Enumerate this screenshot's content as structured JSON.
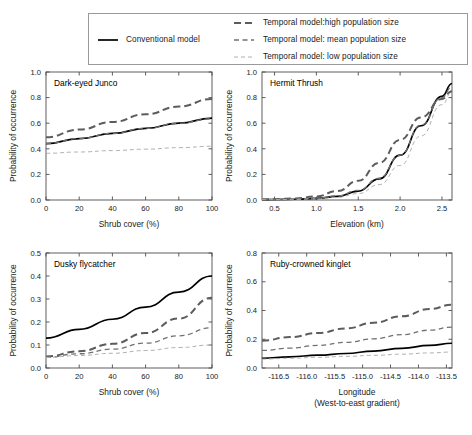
{
  "legend": {
    "entries": [
      {
        "label": "Conventional model",
        "style": "solid",
        "color": "#000000",
        "width": 1.7,
        "dash": "none",
        "position": "left"
      },
      {
        "label": "Temporal model:high population size",
        "style": "dashed",
        "color": "#5c5c5c",
        "width": 2.0,
        "dash": "7,4",
        "position": "right"
      },
      {
        "label": "Temporal model: mean population size",
        "style": "dashed",
        "color": "#707070",
        "width": 1.3,
        "dash": "5,3.5",
        "position": "right"
      },
      {
        "label": "Temporal model: low population size",
        "style": "dashed",
        "color": "#b0b0b0",
        "width": 1.0,
        "dash": "4,3",
        "position": "right"
      }
    ]
  },
  "chart_data": [
    {
      "type": "line",
      "title": "Dark-eyed Junco",
      "xlabel": "Shrub cover (%)",
      "ylabel": "Probability of occurrence",
      "xlim": [
        0,
        100
      ],
      "ylim": [
        0,
        1.0
      ],
      "xticks": [
        0,
        20,
        40,
        60,
        80,
        100
      ],
      "xticklabels": [
        "0",
        "20",
        "40",
        "60",
        "80",
        "100"
      ],
      "yticks": [
        0.0,
        0.2,
        0.4,
        0.6,
        0.8,
        1.0
      ],
      "yticklabels": [
        "0.0",
        "0.2",
        "0.4",
        "0.6",
        "0.8",
        "1.0"
      ],
      "grid": false,
      "series": [
        {
          "name": "Conventional model",
          "style": "solid",
          "color": "#000000",
          "width": 1.7,
          "dash": "none",
          "x": [
            0,
            20,
            40,
            60,
            80,
            100
          ],
          "values": [
            0.44,
            0.48,
            0.52,
            0.56,
            0.6,
            0.64
          ]
        },
        {
          "name": "Temporal model:high population size",
          "style": "dashed",
          "color": "#5c5c5c",
          "width": 2.0,
          "dash": "7,4",
          "x": [
            0,
            20,
            40,
            60,
            80,
            100
          ],
          "values": [
            0.49,
            0.55,
            0.61,
            0.67,
            0.73,
            0.79
          ]
        },
        {
          "name": "Temporal model: mean population size",
          "style": "dashed",
          "color": "#707070",
          "width": 1.3,
          "dash": "5,3.5",
          "x": [
            0,
            20,
            40,
            60,
            80,
            100
          ],
          "values": [
            0.44,
            0.48,
            0.52,
            0.56,
            0.6,
            0.635
          ]
        },
        {
          "name": "Temporal model: low population size",
          "style": "dashed",
          "color": "#b0b0b0",
          "width": 1.0,
          "dash": "4,3",
          "x": [
            0,
            20,
            40,
            60,
            80,
            100
          ],
          "values": [
            0.365,
            0.375,
            0.386,
            0.397,
            0.409,
            0.42
          ]
        }
      ]
    },
    {
      "type": "line",
      "title": "Hermit Thrush",
      "xlabel": "Elevation (km)",
      "ylabel": "Probability of occurrence",
      "xlim": [
        0.35,
        2.62
      ],
      "ylim": [
        0,
        1.0
      ],
      "xticks": [
        0.5,
        1.0,
        1.5,
        2.0,
        2.5
      ],
      "xticklabels": [
        "0.5",
        "1.0",
        "1.5",
        "2.0",
        "2.5"
      ],
      "yticks": [
        0.0,
        0.2,
        0.4,
        0.6,
        0.8,
        1.0
      ],
      "yticklabels": [
        "0.0",
        "0.2",
        "0.4",
        "0.6",
        "0.8",
        "1.0"
      ],
      "grid": false,
      "series": [
        {
          "name": "Conventional model",
          "style": "solid",
          "color": "#000000",
          "width": 1.7,
          "dash": "none",
          "x": [
            0.35,
            0.5,
            0.75,
            1.0,
            1.25,
            1.5,
            1.75,
            2.0,
            2.25,
            2.5,
            2.62
          ],
          "values": [
            0.003,
            0.004,
            0.006,
            0.012,
            0.028,
            0.07,
            0.165,
            0.35,
            0.58,
            0.81,
            0.91
          ]
        },
        {
          "name": "Temporal model:high population size",
          "style": "dashed",
          "color": "#5c5c5c",
          "width": 2.0,
          "dash": "7,4",
          "x": [
            0.35,
            0.5,
            0.75,
            1.0,
            1.25,
            1.5,
            1.75,
            2.0,
            2.25,
            2.5,
            2.62
          ],
          "values": [
            0.004,
            0.006,
            0.012,
            0.028,
            0.07,
            0.15,
            0.29,
            0.47,
            0.645,
            0.79,
            0.85
          ]
        },
        {
          "name": "Temporal model: mean population size",
          "style": "dashed",
          "color": "#707070",
          "width": 1.3,
          "dash": "5,3.5",
          "x": [
            0.35,
            0.5,
            0.75,
            1.0,
            1.25,
            1.5,
            1.75,
            2.0,
            2.25,
            2.5,
            2.62
          ],
          "values": [
            0.003,
            0.004,
            0.007,
            0.014,
            0.032,
            0.075,
            0.17,
            0.35,
            0.585,
            0.8,
            0.885
          ]
        },
        {
          "name": "Temporal model: low population size",
          "style": "dashed",
          "color": "#b0b0b0",
          "width": 1.0,
          "dash": "4,3",
          "x": [
            0.35,
            0.5,
            0.75,
            1.0,
            1.25,
            1.5,
            1.75,
            2.0,
            2.25,
            2.5,
            2.62
          ],
          "values": [
            0.002,
            0.003,
            0.005,
            0.009,
            0.021,
            0.05,
            0.12,
            0.27,
            0.5,
            0.745,
            0.845
          ]
        }
      ]
    },
    {
      "type": "line",
      "title": "Dusky flycatcher",
      "xlabel": "Shrub cover (%)",
      "ylabel": "Probability of occurrence",
      "xlim": [
        0,
        100
      ],
      "ylim": [
        0,
        0.5
      ],
      "xticks": [
        0,
        20,
        40,
        60,
        80,
        100
      ],
      "xticklabels": [
        "0",
        "20",
        "40",
        "60",
        "80",
        "100"
      ],
      "yticks": [
        0.0,
        0.1,
        0.2,
        0.3,
        0.4,
        0.5
      ],
      "yticklabels": [
        "0.0",
        "0.1",
        "0.2",
        "0.3",
        "0.4",
        "0.5"
      ],
      "grid": false,
      "series": [
        {
          "name": "Conventional model",
          "style": "solid",
          "color": "#000000",
          "width": 1.7,
          "dash": "none",
          "x": [
            0,
            20,
            40,
            60,
            80,
            100
          ],
          "values": [
            0.13,
            0.168,
            0.212,
            0.265,
            0.33,
            0.4
          ]
        },
        {
          "name": "Temporal model:high population size",
          "style": "dashed",
          "color": "#5c5c5c",
          "width": 2.0,
          "dash": "7,4",
          "x": [
            0,
            20,
            40,
            60,
            80,
            100
          ],
          "values": [
            0.05,
            0.073,
            0.105,
            0.152,
            0.215,
            0.305
          ]
        },
        {
          "name": "Temporal model: mean population size",
          "style": "dashed",
          "color": "#707070",
          "width": 1.3,
          "dash": "5,3.5",
          "x": [
            0,
            20,
            40,
            60,
            80,
            100
          ],
          "values": [
            0.047,
            0.062,
            0.082,
            0.108,
            0.14,
            0.175
          ]
        },
        {
          "name": "Temporal model: low population size",
          "style": "dashed",
          "color": "#b0b0b0",
          "width": 1.0,
          "dash": "4,3",
          "x": [
            0,
            20,
            40,
            60,
            80,
            100
          ],
          "values": [
            0.046,
            0.054,
            0.064,
            0.076,
            0.089,
            0.1
          ]
        }
      ]
    },
    {
      "type": "line",
      "title": "Ruby-crowned kinglet",
      "xlabel": "Longitude",
      "xlabel2": "(West-to-east gradient)",
      "ylabel": "Probability of occurrence",
      "xlim": [
        -116.8,
        -113.4
      ],
      "ylim": [
        0,
        0.8
      ],
      "xticks": [
        -116.5,
        -116.0,
        -115.5,
        -115.0,
        -114.5,
        -114.0,
        -113.5
      ],
      "xticklabels": [
        "-116.5",
        "-116.0",
        "-115.5",
        "-115.0",
        "-114.5",
        "-114.0",
        "-113.5"
      ],
      "yticks": [
        0.0,
        0.2,
        0.4,
        0.6,
        0.8
      ],
      "yticklabels": [
        "0.0",
        "0.2",
        "0.4",
        "0.6",
        "0.8"
      ],
      "grid": false,
      "series": [
        {
          "name": "Conventional model",
          "style": "solid",
          "color": "#000000",
          "width": 1.7,
          "dash": "none",
          "x": [
            -116.8,
            -116.3,
            -115.8,
            -115.3,
            -114.8,
            -114.3,
            -113.8,
            -113.4
          ],
          "values": [
            0.068,
            0.078,
            0.089,
            0.101,
            0.118,
            0.137,
            0.157,
            0.172
          ]
        },
        {
          "name": "Temporal model:high population size",
          "style": "dashed",
          "color": "#5c5c5c",
          "width": 2.0,
          "dash": "7,4",
          "x": [
            -116.8,
            -116.3,
            -115.8,
            -115.3,
            -114.8,
            -114.3,
            -113.8,
            -113.4
          ],
          "values": [
            0.19,
            0.215,
            0.243,
            0.275,
            0.315,
            0.36,
            0.41,
            0.44
          ]
        },
        {
          "name": "Temporal model: mean population size",
          "style": "dashed",
          "color": "#707070",
          "width": 1.3,
          "dash": "5,3.5",
          "x": [
            -116.8,
            -116.3,
            -115.8,
            -115.3,
            -114.8,
            -114.3,
            -113.8,
            -113.4
          ],
          "values": [
            0.122,
            0.138,
            0.157,
            0.178,
            0.203,
            0.232,
            0.263,
            0.285
          ]
        },
        {
          "name": "Temporal model: low population size",
          "style": "dashed",
          "color": "#b0b0b0",
          "width": 1.0,
          "dash": "4,3",
          "x": [
            -116.8,
            -116.3,
            -115.8,
            -115.3,
            -114.8,
            -114.3,
            -113.8,
            -113.4
          ],
          "values": [
            0.062,
            0.068,
            0.074,
            0.081,
            0.088,
            0.096,
            0.105,
            0.111
          ]
        }
      ]
    }
  ]
}
